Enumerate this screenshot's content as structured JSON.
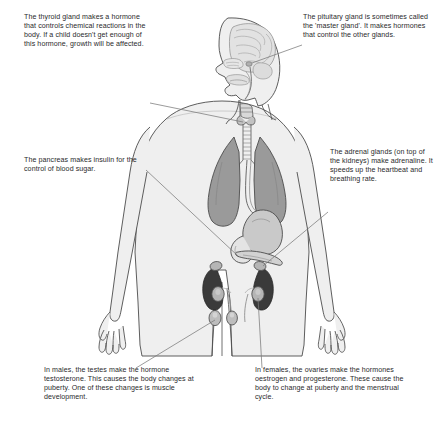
{
  "diagram": {
    "style": "grayscale line illustration with leader-line captions"
  },
  "captions": {
    "thyroid": {
      "id": "thyroid-caption",
      "text": "The thyroid gland makes a hormone that controls chemical reactions in the body. If a child doesn't get enough of this hormone, growth will be affected.",
      "gland": "thyroid"
    },
    "pituitary": {
      "id": "pituitary-caption",
      "text": "The pituitary gland is sometimes called the 'master gland'. It makes hormones that control the other glands.",
      "gland": "pituitary"
    },
    "pancreas": {
      "id": "pancreas-caption",
      "text": "The pancreas makes insulin for the control of blood sugar.",
      "gland": "pancreas"
    },
    "adrenal": {
      "id": "adrenal-caption",
      "text": "The adrenal glands (on top of the kidneys) make adrenaline. It speeds up the heartbeat and breathing rate.",
      "gland": "adrenal"
    },
    "testes": {
      "id": "testes-caption",
      "text": "In males, the testes make the hormone testosterone. This causes the body changes at puberty. One of these changes is muscle development.",
      "gland": "testes"
    },
    "ovaries": {
      "id": "ovaries-caption",
      "text": "In females, the ovaries make the hormones oestrogen and progesterone. These cause the body to change at puberty and the menstrual cycle.",
      "gland": "ovaries"
    }
  },
  "figure": {
    "parts": [
      "brain",
      "nasal-cavity",
      "mouth",
      "tongue",
      "trachea",
      "larynx",
      "thyroid",
      "left-lung",
      "right-lung",
      "heart-region",
      "oesophagus",
      "stomach",
      "pancreas",
      "left-kidney",
      "right-kidney",
      "ureters",
      "adrenal-glands",
      "ovaries",
      "testes",
      "arms",
      "hands",
      "legs"
    ]
  },
  "colors": {
    "background": "#ffffff",
    "body_fill": "#efefef",
    "body_outline": "#4c4c4c",
    "lung_fill": "#9a9a9a",
    "brain_fill": "#e2e2e2",
    "stomach_fill": "#c9c9c9",
    "kidney_fill": "#3a3a3a",
    "gland_fill": "#b5b5b5",
    "leader_line": "#7a7a7a",
    "text": "#2a2a2c"
  }
}
